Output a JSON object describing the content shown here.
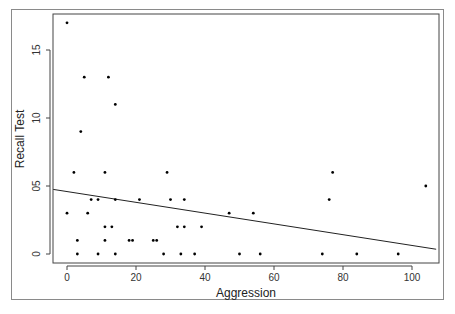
{
  "chart_data": {
    "type": "scatter",
    "title": "",
    "xlabel": "Aggression",
    "ylabel": "Recall Test",
    "xlim": [
      -4,
      107
    ],
    "ylim": [
      -0.7,
      17.6
    ],
    "x_ticks": [
      0,
      20,
      40,
      60,
      80,
      100
    ],
    "x_tick_labels": [
      "0",
      "20",
      "40",
      "60",
      "80",
      "100"
    ],
    "y_ticks": [
      0,
      5,
      10,
      15
    ],
    "y_tick_labels": [
      "0",
      "05",
      "10",
      "15"
    ],
    "grid": false,
    "legend": null,
    "points": [
      {
        "x": 0,
        "y": 17
      },
      {
        "x": 5,
        "y": 13
      },
      {
        "x": 12,
        "y": 13
      },
      {
        "x": 14,
        "y": 11
      },
      {
        "x": 4,
        "y": 9
      },
      {
        "x": 2,
        "y": 6
      },
      {
        "x": 11,
        "y": 6
      },
      {
        "x": 29,
        "y": 6
      },
      {
        "x": 77,
        "y": 6
      },
      {
        "x": 104,
        "y": 5
      },
      {
        "x": 7,
        "y": 4
      },
      {
        "x": 9,
        "y": 4
      },
      {
        "x": 14,
        "y": 4
      },
      {
        "x": 21,
        "y": 4
      },
      {
        "x": 30,
        "y": 4
      },
      {
        "x": 34,
        "y": 4
      },
      {
        "x": 76,
        "y": 4
      },
      {
        "x": 0,
        "y": 3
      },
      {
        "x": 6,
        "y": 3
      },
      {
        "x": 47,
        "y": 3
      },
      {
        "x": 54,
        "y": 3
      },
      {
        "x": 11,
        "y": 2
      },
      {
        "x": 13,
        "y": 2
      },
      {
        "x": 32,
        "y": 2
      },
      {
        "x": 34,
        "y": 2
      },
      {
        "x": 39,
        "y": 2
      },
      {
        "x": 3,
        "y": 1
      },
      {
        "x": 11,
        "y": 1
      },
      {
        "x": 18,
        "y": 1
      },
      {
        "x": 19,
        "y": 1
      },
      {
        "x": 25,
        "y": 1
      },
      {
        "x": 26,
        "y": 1
      },
      {
        "x": 3,
        "y": 0
      },
      {
        "x": 9,
        "y": 0
      },
      {
        "x": 14,
        "y": 0
      },
      {
        "x": 28,
        "y": 0
      },
      {
        "x": 33,
        "y": 0
      },
      {
        "x": 37,
        "y": 0
      },
      {
        "x": 50,
        "y": 0
      },
      {
        "x": 56,
        "y": 0
      },
      {
        "x": 74,
        "y": 0
      },
      {
        "x": 84,
        "y": 0
      },
      {
        "x": 96,
        "y": 0
      }
    ],
    "regression_line": {
      "x0": -4,
      "y0": 4.75,
      "x1": 107,
      "y1": 0.35
    },
    "colors": {
      "points": "#000000",
      "line": "#222222",
      "frame": "#8a8a8a"
    }
  }
}
